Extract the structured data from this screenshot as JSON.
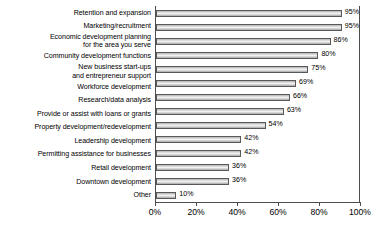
{
  "chart_data": {
    "type": "bar",
    "orientation": "horizontal",
    "title": "",
    "subtitle": "",
    "xlabel": "",
    "ylabel": "",
    "xlim": [
      0,
      100
    ],
    "xticks": [
      "0%",
      "20%",
      "40%",
      "60%",
      "80%",
      "100%"
    ],
    "xtick_values": [
      0,
      20,
      40,
      60,
      80,
      100
    ],
    "grid": false,
    "legend": null,
    "categories": [
      "Retention and expansion",
      "Marketing/recruitment",
      "Economic development planning for the area you serve",
      "Community development functions",
      "New business start-ups and entrepreneur support",
      "Workforce development",
      "Research/data analysis",
      "Provide or assist with loans or grants",
      "Property development/redevelopment",
      "Leadership development",
      "Permitting assistance for businesses",
      "Retail development",
      "Downtown development",
      "Other"
    ],
    "values": [
      95,
      95,
      86,
      80,
      75,
      69,
      66,
      63,
      54,
      42,
      42,
      36,
      36,
      10
    ],
    "value_labels": [
      "95%",
      "95%",
      "86%",
      "80%",
      "75%",
      "69%",
      "66%",
      "63%",
      "54%",
      "42%",
      "42%",
      "36%",
      "36%",
      "10%"
    ]
  },
  "rows": [
    {
      "lines": [
        "Retention and expansion"
      ],
      "value": 95,
      "label": "95%"
    },
    {
      "lines": [
        "Marketing/recruitment"
      ],
      "value": 95,
      "label": "95%"
    },
    {
      "lines": [
        "Economic development planning",
        "for the area you serve"
      ],
      "value": 86,
      "label": "86%"
    },
    {
      "lines": [
        "Community development functions"
      ],
      "value": 80,
      "label": "80%"
    },
    {
      "lines": [
        "New business start-ups",
        "and entrepreneur support"
      ],
      "value": 75,
      "label": "75%"
    },
    {
      "lines": [
        "Workforce development"
      ],
      "value": 69,
      "label": "69%"
    },
    {
      "lines": [
        "Research/data analysis"
      ],
      "value": 66,
      "label": "66%"
    },
    {
      "lines": [
        "Provide or assist with loans or grants"
      ],
      "value": 63,
      "label": "63%"
    },
    {
      "lines": [
        "Property development/redevelopment"
      ],
      "value": 54,
      "label": "54%"
    },
    {
      "lines": [
        "Leadership development"
      ],
      "value": 42,
      "label": "42%"
    },
    {
      "lines": [
        "Permitting assistance for businesses"
      ],
      "value": 42,
      "label": "42%"
    },
    {
      "lines": [
        "Retail development"
      ],
      "value": 36,
      "label": "36%"
    },
    {
      "lines": [
        "Downtown development"
      ],
      "value": 36,
      "label": "36%"
    },
    {
      "lines": [
        "Other"
      ],
      "value": 10,
      "label": "10%"
    }
  ],
  "axis": {
    "ticks": [
      {
        "label": "0%",
        "value": 0
      },
      {
        "label": "20%",
        "value": 20
      },
      {
        "label": "40%",
        "value": 40
      },
      {
        "label": "60%",
        "value": 60
      },
      {
        "label": "80%",
        "value": 80
      },
      {
        "label": "100%",
        "value": 100
      }
    ]
  },
  "colors": {
    "bar_border": "#58585a",
    "bar_fill_light": "#f2f2f2",
    "bar_fill_dark": "#a9a9a9",
    "axis": "#4d4d4d",
    "text": "#000000",
    "background": "#ffffff"
  }
}
